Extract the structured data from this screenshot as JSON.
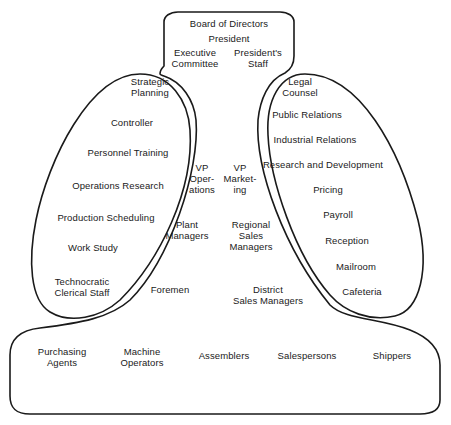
{
  "diagram": {
    "type": "organization-structure",
    "colors": {
      "stroke": "#1a1a1a",
      "text": "#1a1a1a",
      "background": "#ffffff"
    },
    "strategic_apex": {
      "board": "Board of Directors",
      "president": "President",
      "executive_committee": "Executive\nCommittee",
      "presidents_staff": "President's\nStaff"
    },
    "technostructure": {
      "items": [
        "Strategic\nPlanning",
        "Controller",
        "Personnel Training",
        "Operations Research",
        "Production Scheduling",
        "Work Study",
        "Technocratic\nClerical Staff"
      ]
    },
    "middle_line": {
      "operations": [
        "VP\nOper-\nations",
        "Plant\nManagers",
        "Foremen"
      ],
      "marketing": [
        "VP\nMarket-\ning",
        "Regional\nSales\nManagers",
        "District\nSales Managers"
      ]
    },
    "support_staff": {
      "items": [
        "Legal\nCounsel",
        "Public Relations",
        "Industrial Relations",
        "Research and Development",
        "Pricing",
        "Payroll",
        "Reception",
        "Mailroom",
        "Cafeteria"
      ]
    },
    "operating_core": {
      "items": [
        "Purchasing\nAgents",
        "Machine\nOperators",
        "Assemblers",
        "Salespersons",
        "Shippers"
      ]
    }
  }
}
